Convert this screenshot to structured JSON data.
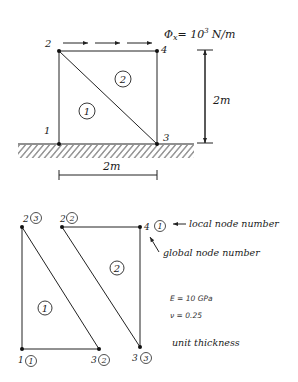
{
  "top_diagram": {
    "load_label": "Φx= 10³ N/m",
    "load_symbol": "Φ",
    "load_sub": "x",
    "load_eq": "= 10",
    "load_exp": "3",
    "load_unit": "N/m",
    "height_dim": "2m",
    "width_dim": "2m",
    "nodes": [
      {
        "id": "1",
        "x": 59,
        "y": 144
      },
      {
        "id": "2",
        "x": 59,
        "y": 51
      },
      {
        "id": "3",
        "x": 157,
        "y": 144
      },
      {
        "id": "4",
        "x": 157,
        "y": 51
      }
    ],
    "elements": [
      {
        "id": "1"
      },
      {
        "id": "2"
      }
    ]
  },
  "bottom_diagram": {
    "element1": {
      "id": "1",
      "nodes": [
        {
          "global": "1",
          "local": "1"
        },
        {
          "global": "2",
          "local": "3"
        },
        {
          "global": "3",
          "local": "2"
        }
      ]
    },
    "element2": {
      "id": "2",
      "nodes": [
        {
          "global": "2",
          "local": "2"
        },
        {
          "global": "4",
          "local": "1"
        },
        {
          "global": "3",
          "local": "3"
        }
      ]
    },
    "legend": {
      "local_node_label": "local node number",
      "global_node_label": "global node number"
    },
    "properties": {
      "E": "E = 10 GPa",
      "nu": "ν = 0.25",
      "thickness": "unit thickness"
    }
  }
}
